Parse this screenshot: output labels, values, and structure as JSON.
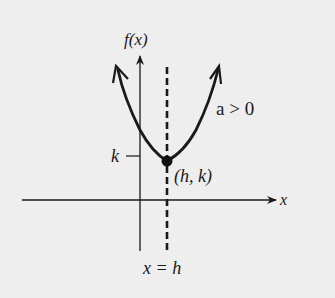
{
  "diagram": {
    "type": "parabola-vertex-form",
    "y_axis_label": "f(x)",
    "x_axis_label": "x",
    "condition_label": "a > 0",
    "vertex_label": "(h, k)",
    "k_tick_label": "k",
    "axis_of_symmetry_label": "x = h",
    "colors": {
      "background": "#eeeeee",
      "ink": "#1a1a1a"
    }
  }
}
